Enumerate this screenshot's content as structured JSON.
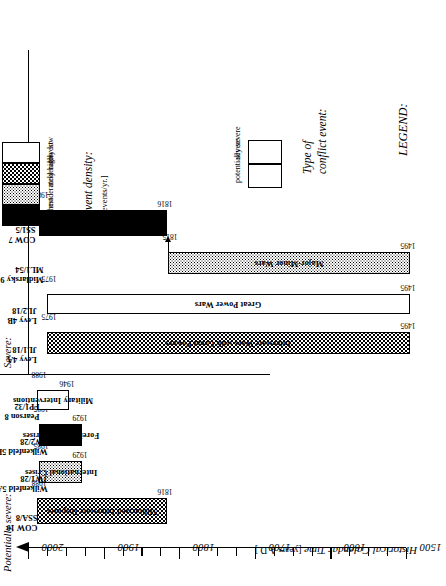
{
  "axis": {
    "title_main": "Historical Calendar Time",
    "title_unit": "[years A.D.]",
    "labels": [
      "1500",
      "1600",
      "1700",
      "1800",
      "1900",
      "2000"
    ],
    "min": 1500,
    "max": 2000,
    "major_step": 100,
    "minor_step": 25
  },
  "groups": {
    "potentially_severe": "Potentially severe:",
    "severe": "Severe:"
  },
  "chart_data": {
    "type": "bar",
    "title": "Historical Calendar Time [years A.D.]",
    "xlabel": "Historical Calendar Time",
    "ylabel": "",
    "xlim": [
      1500,
      2000
    ],
    "grid": false,
    "orientation": "horizontal-time-axis",
    "legend": "LEGEND:",
    "series": [
      {
        "name": "Militarized Interstate Disputes",
        "group": "potentially severe",
        "source": "COW 10",
        "code": "SSA/8",
        "start": 1816,
        "end": 1988,
        "start_label": "1816",
        "end_label": "1988",
        "density": "moderately low",
        "fill": "light"
      },
      {
        "name": "International Crises",
        "group": "potentially severe",
        "source": "Wilkenfeld 5A",
        "code": "JW1/28",
        "start": 1929,
        "end": 1985,
        "start_label": "1929",
        "end_label": "1985",
        "density": "moderately high",
        "fill": "dark"
      },
      {
        "name": "Foreign Policy Crises",
        "group": "potentially severe",
        "source": "Wilkenfeld 5B",
        "code": "JW2/28",
        "start": 1929,
        "end": 1985,
        "start_label": "1929",
        "end_label": "1985",
        "density": "highest",
        "fill": "black"
      },
      {
        "name": "Military Interventions",
        "group": "potentially severe",
        "source": "Pearson 8",
        "code": "FP1/32",
        "start": 1946,
        "end": 1988,
        "start_label": "1946",
        "end_label": "1988",
        "density": "lowest",
        "fill": "white"
      },
      {
        "name": "Interstate Wars with Great Powers",
        "group": "severe",
        "source": "Levy 4A",
        "code": "JL1/18",
        "start": 1495,
        "end": 1975,
        "start_label": "1495",
        "end_label": "1975",
        "density": "moderately low",
        "fill": "light"
      },
      {
        "name": "Great Power Wars",
        "group": "severe",
        "source": "Levy 4B",
        "code": "JL2/18",
        "start": 1495,
        "end": 1975,
        "start_label": "1495",
        "end_label": "1975",
        "density": "lowest",
        "fill": "white"
      },
      {
        "name": "Major-Minor Wars",
        "group": "severe",
        "source": "Midlarsky 9",
        "code": "ML1/54",
        "start": 1495,
        "end": 1815,
        "start_label": "1495",
        "end_label": "1815",
        "density": "moderately high",
        "fill": "dark"
      },
      {
        "name": "Interstate Wars",
        "group": "severe",
        "source": "COW 7",
        "code": "SS1/5",
        "start": 1816,
        "end": 1986,
        "start_label": "1816",
        "end_label": "1986",
        "density": "highest",
        "fill": "black"
      }
    ]
  },
  "legend": {
    "title": "LEGEND:",
    "density": {
      "title": "Event density:",
      "unit": "[events/yr.]",
      "levels": [
        "highest",
        "moderately high",
        "moderately low",
        "lowest"
      ]
    },
    "conflict_type": {
      "title_line1": "Type of",
      "title_line2": "conflict event:",
      "options": [
        "potentially severe",
        "severe"
      ]
    }
  }
}
